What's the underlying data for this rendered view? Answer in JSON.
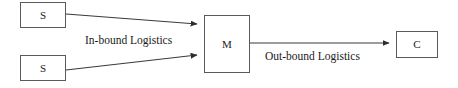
{
  "diagram": {
    "nodes": [
      {
        "id": "supplier-1",
        "label": "S",
        "role": "supplier"
      },
      {
        "id": "supplier-2",
        "label": "S",
        "role": "supplier"
      },
      {
        "id": "manufacturer",
        "label": "M",
        "role": "manufacturer"
      },
      {
        "id": "customer",
        "label": "C",
        "role": "customer"
      }
    ],
    "edges": [
      {
        "id": "edge-supplier-1-to-manufacturer",
        "from": "supplier-1",
        "to": "manufacturer",
        "label": "In-bound Logistics"
      },
      {
        "id": "edge-supplier-2-to-manufacturer",
        "from": "supplier-2",
        "to": "manufacturer",
        "label": ""
      },
      {
        "id": "edge-manufacturer-to-customer",
        "from": "manufacturer",
        "to": "customer",
        "label": "Out-bound Logistics"
      }
    ],
    "labels": {
      "inbound": "In-bound Logistics",
      "outbound": "Out-bound Logistics"
    },
    "colors": {
      "background": "#ffffff",
      "box_border": "#5a5a5a",
      "text": "#1a1a1a",
      "edge_line": "#3a3a3a"
    }
  }
}
